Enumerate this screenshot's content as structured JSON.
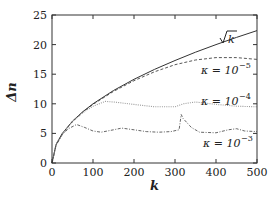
{
  "chart_data": {
    "type": "line",
    "title": "",
    "xlabel": "k",
    "ylabel": "Δn",
    "xlim": [
      0,
      500
    ],
    "ylim": [
      0,
      25
    ],
    "xticks": [
      0,
      100,
      200,
      300,
      400,
      500
    ],
    "yticks": [
      0,
      5,
      10,
      15,
      20,
      25
    ],
    "grid": false,
    "legend_position": "inline annotations at right",
    "series": [
      {
        "name": "√k",
        "label": "√k",
        "style": "solid",
        "x": [
          0,
          10,
          25,
          50,
          75,
          100,
          150,
          200,
          250,
          300,
          350,
          400,
          450,
          500
        ],
        "y": [
          0,
          3.16,
          5.0,
          7.07,
          8.66,
          10.0,
          12.25,
          14.14,
          15.81,
          17.32,
          18.71,
          20.0,
          21.21,
          22.36
        ]
      },
      {
        "name": "κ = 10^-5",
        "label": "κ = 10⁻⁵",
        "style": "dashed",
        "x": [
          0,
          10,
          25,
          50,
          75,
          100,
          150,
          200,
          250,
          300,
          350,
          400,
          450,
          500
        ],
        "y": [
          0,
          3.1,
          4.9,
          7.0,
          8.6,
          9.9,
          12.1,
          13.9,
          15.4,
          16.6,
          17.4,
          17.8,
          17.8,
          17.5
        ]
      },
      {
        "name": "κ = 10^-4",
        "label": "κ = 10⁻⁴",
        "style": "dotted",
        "x": [
          0,
          10,
          25,
          50,
          75,
          100,
          130,
          150,
          200,
          250,
          300,
          320,
          350,
          400,
          450,
          500
        ],
        "y": [
          0,
          3.1,
          4.9,
          7.0,
          8.5,
          9.6,
          10.4,
          10.3,
          9.9,
          9.5,
          9.5,
          10.0,
          10.3,
          9.9,
          9.6,
          9.5
        ]
      },
      {
        "name": "κ = 10^-3",
        "label": "κ = 10⁻³",
        "style": "dash-dot",
        "x": [
          0,
          10,
          25,
          40,
          60,
          80,
          100,
          120,
          150,
          170,
          200,
          230,
          260,
          290,
          310,
          315,
          320,
          340,
          360,
          400,
          430,
          450,
          470,
          500
        ],
        "y": [
          0,
          3.0,
          4.8,
          5.8,
          6.5,
          6.0,
          5.4,
          5.2,
          5.6,
          5.9,
          5.6,
          5.3,
          5.2,
          5.3,
          5.6,
          8.2,
          7.5,
          6.0,
          5.2,
          5.1,
          5.6,
          5.8,
          5.4,
          5.3
        ]
      }
    ]
  },
  "annotations": {
    "sqrt_k": "√k",
    "kappa_5": "κ = 10",
    "kappa_5_exp": "−5",
    "kappa_4": "κ = 10",
    "kappa_4_exp": "−4",
    "kappa_3": "κ = 10",
    "kappa_3_exp": "−3"
  },
  "axes": {
    "x_label": "k",
    "y_label": "Δn",
    "x_ticks": [
      "0",
      "100",
      "200",
      "300",
      "400",
      "500"
    ],
    "y_ticks": [
      "0",
      "5",
      "10",
      "15",
      "20",
      "25"
    ]
  }
}
